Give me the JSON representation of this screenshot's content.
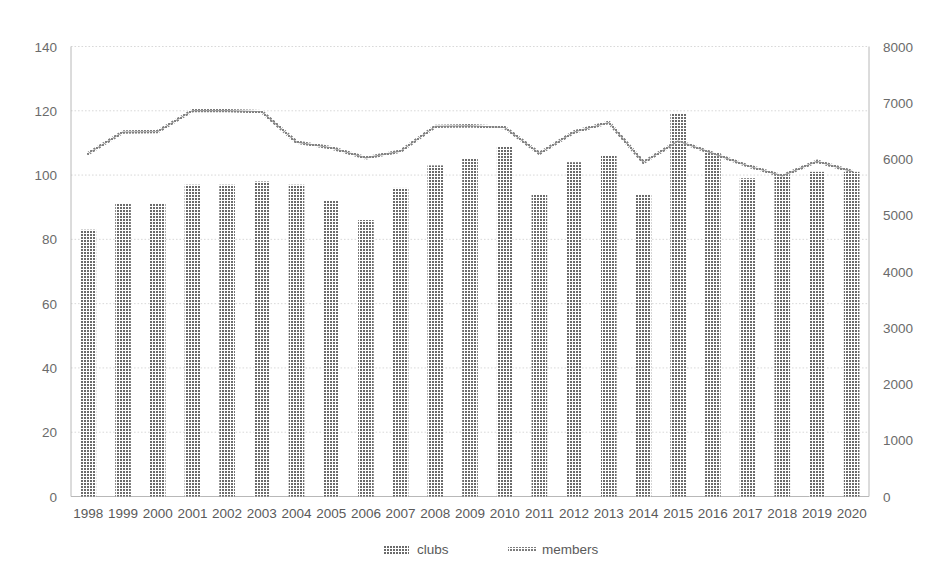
{
  "chart_data": {
    "type": "bar",
    "title": "",
    "subtitle": "",
    "xlabel": "",
    "ylabel": "",
    "categories": [
      "1998",
      "1999",
      "2000",
      "2001",
      "2002",
      "2003",
      "2004",
      "2005",
      "2006",
      "2007",
      "2008",
      "2009",
      "2010",
      "2011",
      "2012",
      "2013",
      "2014",
      "2015",
      "2016",
      "2017",
      "2018",
      "2019",
      "2020"
    ],
    "series": [
      {
        "name": "clubs",
        "type": "bar",
        "axis": "left",
        "color": "#6e6e6e",
        "values": [
          83,
          91,
          91,
          97,
          97,
          98,
          97,
          92,
          86,
          96,
          103,
          105,
          109,
          94,
          104,
          106,
          94,
          119,
          107,
          99,
          100,
          101,
          101
        ]
      },
      {
        "name": "members",
        "type": "line",
        "axis": "right",
        "color": "#808080",
        "values": [
          6100,
          6480,
          6490,
          6860,
          6860,
          6840,
          6300,
          6200,
          6020,
          6140,
          6580,
          6590,
          6560,
          6100,
          6480,
          6650,
          5940,
          6320,
          6100,
          5880,
          5700,
          5960,
          5780
        ]
      }
    ],
    "left_axis": {
      "ticks": [
        "0",
        "20",
        "40",
        "60",
        "80",
        "100",
        "120",
        "140"
      ],
      "min": 0,
      "max": 140
    },
    "right_axis": {
      "ticks": [
        "0",
        "1000",
        "2000",
        "3000",
        "4000",
        "5000",
        "6000",
        "7000",
        "8000"
      ],
      "min": 0,
      "max": 8000
    },
    "grid": true,
    "legend_position": "bottom",
    "legend": [
      {
        "label": "clubs",
        "marker": "hatched-square"
      },
      {
        "label": "members",
        "marker": "hatched-line"
      }
    ]
  }
}
